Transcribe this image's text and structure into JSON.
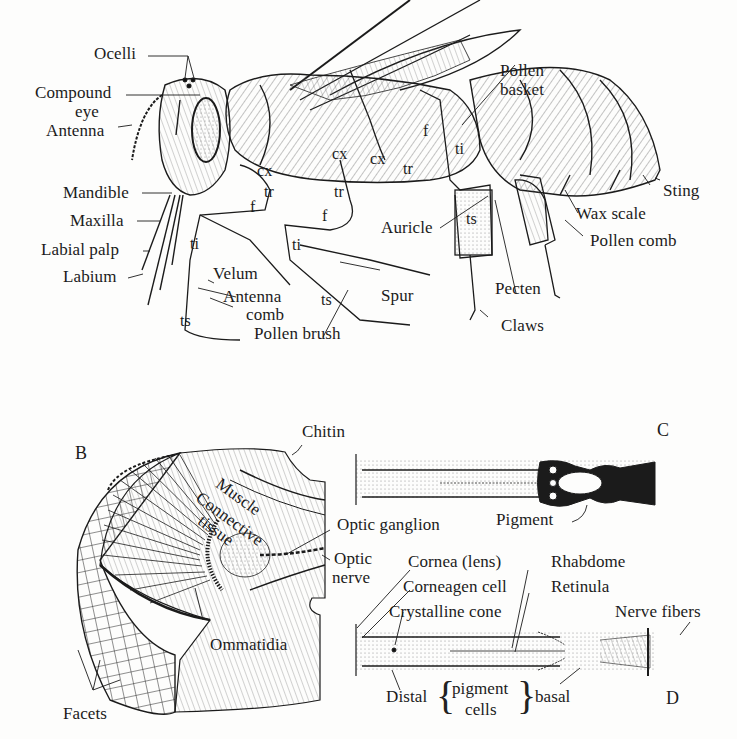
{
  "figure": {
    "panels": {
      "B": "B",
      "C": "C",
      "D": "D"
    },
    "bee_external_anatomy": {
      "labels": {
        "ocelli": "Ocelli",
        "compound_eye_1": "Compound",
        "compound_eye_2": "eye",
        "antenna": "Antenna",
        "mandible": "Mandible",
        "maxilla": "Maxilla",
        "labial_palp": "Labial palp",
        "labium": "Labium",
        "velum": "Velum",
        "antenna_comb_1": "Antenna",
        "antenna_comb_2": "comb",
        "pollen_brush": "Pollen brush",
        "spur": "Spur",
        "auricle": "Auricle",
        "pecten": "Pecten",
        "claws": "Claws",
        "pollen_basket_1": "Pollen",
        "pollen_basket_2": "basket",
        "sting": "Sting",
        "wax_scale": "Wax scale",
        "pollen_comb": "Pollen comb"
      },
      "leg_segments": {
        "front_cx": "cx",
        "front_tr": "tr",
        "front_f": "f",
        "front_ti": "ti",
        "front_ts": "ts",
        "mid_cx": "cx",
        "mid_tr": "tr",
        "mid_f": "f",
        "mid_ti": "ti",
        "mid_ts": "ts",
        "hind_cx": "cx",
        "hind_tr": "tr",
        "hind_f": "f",
        "hind_ti": "ti",
        "hind_ts": "ts"
      }
    },
    "compound_eye_section": {
      "labels": {
        "chitin": "Chitin",
        "muscle": "Muscle",
        "connective_tissue_1": "Connective",
        "connective_tissue_2": "tissue",
        "optic_ganglion": "Optic ganglion",
        "optic_nerve_1": "Optic",
        "optic_nerve_2": "nerve",
        "ommatidia": "Ommatidia",
        "facets": "Facets"
      }
    },
    "ommatidium_light_adapted": {
      "labels": {
        "pigment": "Pigment"
      }
    },
    "ommatidium_dark_adapted": {
      "labels": {
        "cornea": "Cornea (lens)",
        "corneagen_cell": "Corneagen cell",
        "crystalline_cone": "Crystalline cone",
        "rhabdome": "Rhabdome",
        "retinula": "Retinula",
        "nerve_fibers": "Nerve fibers",
        "distal": "Distal",
        "pigment_cells_1": "pigment",
        "pigment_cells_2": "cells",
        "basal": "basal"
      }
    },
    "colors": {
      "ink": "#1b1b1b",
      "paper": "#fdfdfc",
      "pigment_dark": "#111111"
    }
  }
}
